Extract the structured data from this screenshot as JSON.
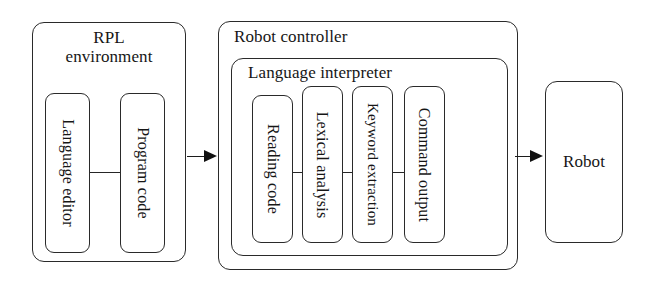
{
  "diagram": {
    "colors": {
      "stroke": "#2a2a2a",
      "text": "#161616",
      "background": "#ffffff",
      "arrow": "#111111"
    },
    "groups": {
      "rpl_environment": {
        "label": "RPL\nenvironment",
        "children": [
          {
            "label": "Language editor"
          },
          {
            "label": "Program code"
          }
        ]
      },
      "robot_controller": {
        "label": "Robot controller",
        "children": {
          "language_interpreter": {
            "label": "Language interpreter",
            "children": [
              {
                "label": "Reading code"
              },
              {
                "label": "Lexical analysis"
              },
              {
                "label": "Keyword extraction"
              },
              {
                "label": "Command output"
              }
            ]
          }
        }
      },
      "robot": {
        "label": "Robot"
      }
    },
    "connectors": [
      {
        "name": "language-editor-to-program-code",
        "kind": "line"
      },
      {
        "name": "rpl-environment-to-robot-controller",
        "kind": "arrow"
      },
      {
        "name": "reading-code-to-lexical-analysis",
        "kind": "line"
      },
      {
        "name": "lexical-analysis-to-keyword-extraction",
        "kind": "line"
      },
      {
        "name": "keyword-extraction-to-command-output",
        "kind": "line"
      },
      {
        "name": "command-output-to-robot",
        "kind": "arrow"
      }
    ]
  }
}
